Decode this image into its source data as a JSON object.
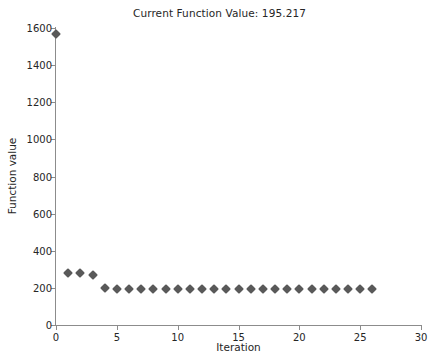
{
  "chart_data": {
    "type": "scatter",
    "title": "Current Function Value: 195.217",
    "xlabel": "Iteration",
    "ylabel": "Function value",
    "xlim": [
      0,
      30
    ],
    "ylim": [
      0,
      1600
    ],
    "xticks": [
      0,
      5,
      10,
      15,
      20,
      25,
      30
    ],
    "yticks": [
      0,
      200,
      400,
      600,
      800,
      1000,
      1200,
      1400,
      1600
    ],
    "grid": false,
    "legend": null,
    "marker": "diamond",
    "marker_color": "#595959",
    "background": "#ffffff",
    "current_function_value": 195.217,
    "series": [
      {
        "name": "Best function value",
        "x": [
          0,
          1,
          2,
          3,
          4,
          5,
          6,
          7,
          8,
          9,
          10,
          11,
          12,
          13,
          14,
          15,
          16,
          17,
          18,
          19,
          20,
          21,
          22,
          23,
          24,
          25,
          26
        ],
        "values": [
          1570,
          281,
          281,
          272,
          198,
          196,
          196,
          196,
          196,
          195,
          195,
          195,
          195,
          195,
          195,
          195,
          195,
          195,
          195,
          195,
          195,
          195,
          195,
          195,
          195,
          195,
          195
        ]
      }
    ]
  },
  "axes": {
    "title": "Current Function Value: 195.217",
    "xlabel": "Iteration",
    "ylabel": "Function value",
    "xtick_labels": [
      "0",
      "5",
      "10",
      "15",
      "20",
      "25",
      "30"
    ],
    "ytick_labels": [
      "0",
      "200",
      "400",
      "600",
      "800",
      "1000",
      "1200",
      "1400",
      "1600"
    ]
  }
}
